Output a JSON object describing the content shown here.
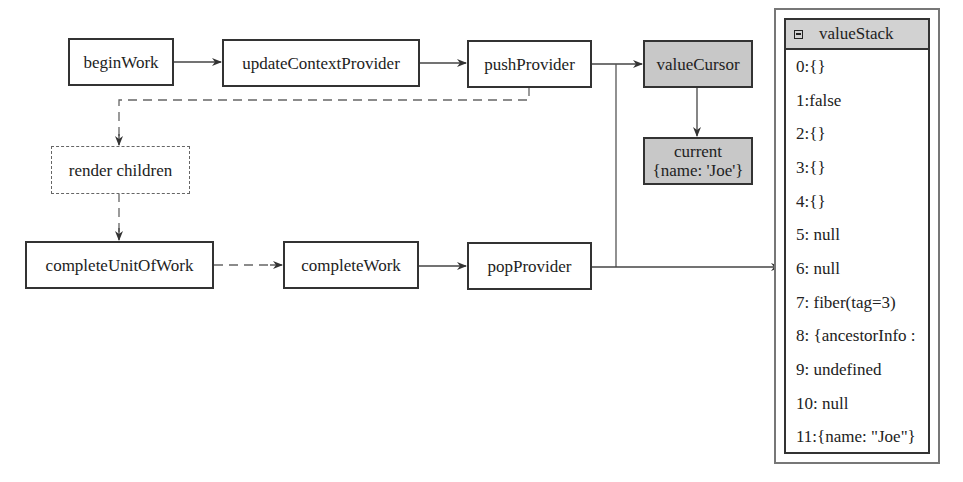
{
  "diagram": {
    "nodes": {
      "begin_work": "beginWork",
      "update_context_provider": "updateContextProvider",
      "push_provider": "pushProvider",
      "value_cursor": "valueCursor",
      "current_line1": "current",
      "current_line2": "{name: 'Joe'}",
      "render_children": "render children",
      "complete_unit_of_work": "completeUnitOfWork",
      "complete_work": "completeWork",
      "pop_provider": "popProvider"
    },
    "value_stack": {
      "title": "valueStack",
      "icon": "collapse-icon",
      "items": [
        "0:{}",
        "1:false",
        "2:{}",
        "3:{}",
        "4:{}",
        "5: null",
        "6: null",
        "7: fiber(tag=3)",
        "8: {ancestorInfo :",
        "9: undefined",
        "10: null",
        "11:{name: \"Joe\"}"
      ]
    },
    "colors": {
      "highlight_fill": "#c8c8c8",
      "border": "#333333",
      "dashed": "#666666"
    }
  }
}
